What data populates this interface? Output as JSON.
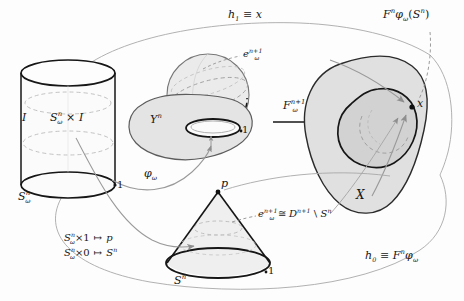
{
  "figure": {
    "domain": "mathematical-diagram",
    "topic": "CW-complex attaching map homotopy diagram",
    "background_color": "#fdfdfd",
    "ink_color": "#161616",
    "shade_color": "#d8d8d8",
    "dash_color": "#8a8a8a",
    "arrow_gray": "#9a9a9a"
  },
  "labels": {
    "homotopy_top": "h₁ ≡ x",
    "image_top_right": "Fⁿφω(Sⁿ)",
    "cylinder_interval": "I",
    "cylinder_body": "Sⁿω × I",
    "cylinder_base": "Sⁿω",
    "cylinder_top_endpoint": "1",
    "cylinder_bottom_endpoint": "1",
    "sphere_cell": "eⁿ⁺¹ω",
    "space_y": "Yⁿ",
    "attach_map": "φω",
    "induced_map": "Fⁿ⁺¹ω",
    "space_x": "X",
    "point_x": "x",
    "cone_apex": "p",
    "cone_base": "Sⁿ",
    "cone_endpoint": "1",
    "cell_iso": "eⁿ⁺¹ω ≅ Dⁿ⁺¹ \\ Sⁿ",
    "homotopy_bottom": "h₀ ≡ Fⁿφω",
    "map_top": "Sⁿω × 1 ↦ p",
    "map_bottom": "Sⁿω × 0 ↦ Sⁿ"
  },
  "label_parts": {
    "h1": {
      "base": "h",
      "sub": "1",
      "rel": " ≡ ",
      "target": "x"
    },
    "h0": {
      "base": "h",
      "sub": "0",
      "rel": " ≡ ",
      "target": "F",
      "target_sup": "n",
      "target_tail": "φ",
      "target_tail_sub": "ω"
    },
    "Fphi_S": {
      "F": "F",
      "Fsup": "n",
      "phi": "φ",
      "phisub": "ω",
      "open": "(",
      "S": "S",
      "Ssup": "n",
      "close": ")"
    },
    "SxI": {
      "S": "S",
      "sup": "n",
      "sub": "ω",
      "times": " × ",
      "I": "I"
    },
    "S_omega": {
      "S": "S",
      "sup": "n",
      "sub": "ω"
    },
    "e_cell": {
      "e": "e",
      "sup": "n+1",
      "sub": "ω"
    },
    "Yn": {
      "Y": "Y",
      "sup": "n"
    },
    "phi_omega": {
      "phi": "φ",
      "sub": "ω"
    },
    "F_np1": {
      "F": "F",
      "sup": "n+1",
      "sub": "ω"
    },
    "cell_iso": {
      "e": "e",
      "esup": "n+1",
      "esub": "ω",
      "cong": " ≅ ",
      "D": "D",
      "Dsup": "n+1",
      "setminus": " \\ ",
      "S": "S",
      "Ssup": "n"
    },
    "map_top": {
      "S": "S",
      "sup": "n",
      "sub": "ω",
      "times": "×",
      "one": "1",
      "mapsto": "↦",
      "p": "p"
    },
    "map_bottom": {
      "S": "S",
      "sup": "n",
      "sub": "ω",
      "times": "×",
      "zero": "0",
      "mapsto": "↦",
      "S2": "S",
      "S2sup": "n"
    }
  },
  "shapes": {
    "cylinder": {
      "cx": 68,
      "top_y": 73,
      "bottom_y": 185,
      "rx": 47,
      "ry": 13
    },
    "sphere": {
      "cx": 208,
      "cy": 95,
      "r": 42
    },
    "blob_y": {
      "cx": 178,
      "cy": 130
    },
    "blob_x": {
      "cx": 372,
      "cy": 135
    },
    "cone": {
      "apex_x": 218,
      "apex_y": 192,
      "base_cy": 263,
      "rx": 52,
      "ry": 15
    }
  }
}
